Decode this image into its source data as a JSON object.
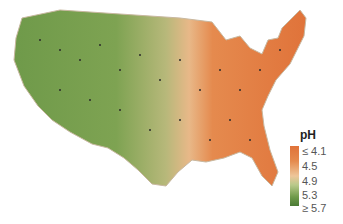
{
  "map": {
    "title": "pH",
    "region": "Contiguous United States",
    "description": "Precipitation pH map; western US green (higher pH), eastern US orange (lower pH)",
    "colors": {
      "low_ph": "#e0733a",
      "mid_ph": "#eec69a",
      "high_ph": "#4a7a35",
      "state_border": "#c8b8a0"
    }
  },
  "legend": {
    "title": "pH",
    "labels": [
      "≤ 4.1",
      "4.5",
      "4.9",
      "5.3",
      "≥ 5.7"
    ]
  }
}
